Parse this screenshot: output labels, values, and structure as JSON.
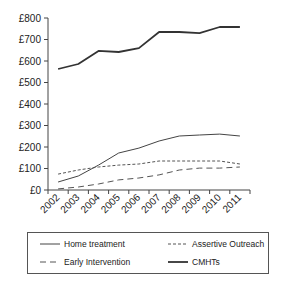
{
  "chart_data": {
    "type": "line",
    "title": "",
    "xlabel": "",
    "ylabel": "",
    "categories": [
      "2002",
      "2003",
      "2004",
      "2005",
      "2006",
      "2007",
      "2008",
      "2009",
      "2010",
      "2011"
    ],
    "ylim": [
      0,
      800
    ],
    "yticks": [
      "£0",
      "£100",
      "£200",
      "£300",
      "£400",
      "£500",
      "£600",
      "£700",
      "£800"
    ],
    "grid": false,
    "legend_position": "bottom",
    "series": [
      {
        "name": "Home treatment",
        "style": "solid-thin",
        "color": "#444444",
        "values": [
          37,
          65,
          116,
          172,
          195,
          228,
          251,
          256,
          260,
          251
        ]
      },
      {
        "name": "Assertive Outreach",
        "style": "short-dash",
        "color": "#555555",
        "values": [
          74,
          93,
          107,
          116,
          121,
          135,
          135,
          135,
          135,
          121
        ]
      },
      {
        "name": "Early Intervention",
        "style": "long-dash",
        "color": "#555555",
        "values": [
          5,
          14,
          28,
          47,
          56,
          70,
          93,
          102,
          102,
          107
        ]
      },
      {
        "name": "CMHTs",
        "style": "solid-thick",
        "color": "#333333",
        "values": [
          563,
          586,
          647,
          642,
          660,
          735,
          735,
          730,
          758,
          758
        ]
      }
    ]
  },
  "legend": {
    "items": [
      {
        "label": "Home treatment"
      },
      {
        "label": "Assertive Outreach"
      },
      {
        "label": "Early Intervention"
      },
      {
        "label": "CMHTs"
      }
    ]
  }
}
